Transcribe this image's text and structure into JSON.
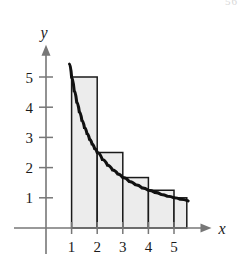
{
  "figure": {
    "caption": "",
    "page_number_fragment": "56"
  },
  "chart_data": {
    "type": "area",
    "title": "",
    "subtitle": "",
    "xlabel": "x",
    "ylabel": "y",
    "xlim": [
      0,
      5.8
    ],
    "ylim": [
      0,
      5.8
    ],
    "grid": false,
    "legend": null,
    "annotations": [],
    "x_ticks": [
      1,
      2,
      3,
      4,
      5
    ],
    "x_tick_labels": [
      "1",
      "2",
      "3",
      "4",
      "5"
    ],
    "y_ticks": [
      1,
      2,
      3,
      4,
      5
    ],
    "y_tick_labels": [
      "1",
      "2",
      "3",
      "4",
      "5"
    ],
    "curve": {
      "name": "f(x) = 5/x",
      "x_start": 0.92,
      "x_end": 5.55,
      "points": [
        [
          0.92,
          5.43
        ],
        [
          1.0,
          5.0
        ],
        [
          1.1,
          4.55
        ],
        [
          1.2,
          4.17
        ],
        [
          1.3,
          3.85
        ],
        [
          1.4,
          3.57
        ],
        [
          1.5,
          3.33
        ],
        [
          1.6,
          3.13
        ],
        [
          1.7,
          2.94
        ],
        [
          1.8,
          2.78
        ],
        [
          1.9,
          2.63
        ],
        [
          2.0,
          2.5
        ],
        [
          2.2,
          2.27
        ],
        [
          2.4,
          2.08
        ],
        [
          2.6,
          1.92
        ],
        [
          2.8,
          1.79
        ],
        [
          3.0,
          1.67
        ],
        [
          3.25,
          1.54
        ],
        [
          3.5,
          1.43
        ],
        [
          3.75,
          1.33
        ],
        [
          4.0,
          1.25
        ],
        [
          4.25,
          1.18
        ],
        [
          4.5,
          1.11
        ],
        [
          4.75,
          1.05
        ],
        [
          5.0,
          1.0
        ],
        [
          5.25,
          0.95
        ],
        [
          5.55,
          0.9
        ]
      ]
    },
    "rectangles": {
      "kind": "left-endpoint Riemann sum",
      "width": 1,
      "bars": [
        {
          "x_left": 1,
          "x_right": 2,
          "height": 5.0
        },
        {
          "x_left": 2,
          "x_right": 3,
          "height": 2.5
        },
        {
          "x_left": 3,
          "x_right": 4,
          "height": 1.67
        },
        {
          "x_left": 4,
          "x_right": 5,
          "height": 1.25
        },
        {
          "x_left": 5,
          "x_right": 5.5,
          "height": 1.0
        }
      ]
    },
    "colors": {
      "bar_fill": "#ececec",
      "bar_stroke": "#1a1a1a",
      "curve": "#111111",
      "axis": "#777777",
      "text": "#1a1a1a"
    }
  }
}
